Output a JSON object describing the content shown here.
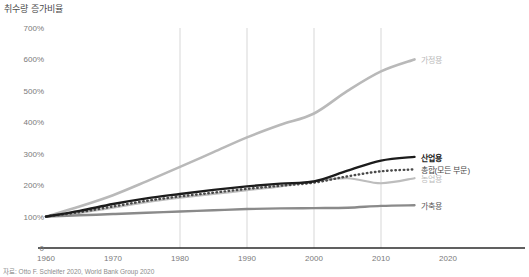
{
  "chart_data": {
    "type": "line",
    "title": "취수량 증가비율",
    "xlabel": "",
    "ylabel": "",
    "xlim": [
      1960,
      2020
    ],
    "ylim": [
      0,
      700
    ],
    "grid": "vertical gridlines at 1980, 1990, 2000, 2010",
    "legend_position": "right-inline labels at end of each series",
    "ytick_labels": [
      "0",
      "100%",
      "200%",
      "300%",
      "400%",
      "500%",
      "600%",
      "700%"
    ],
    "ytick_values": [
      0,
      100,
      200,
      300,
      400,
      500,
      600,
      700
    ],
    "xtick_labels": [
      "1960",
      "1970",
      "1980",
      "1990",
      "2000",
      "2010",
      "2020"
    ],
    "xtick_values": [
      1960,
      1970,
      1980,
      1990,
      2000,
      2010,
      2020
    ],
    "x": [
      1960,
      1965,
      1970,
      1975,
      1980,
      1985,
      1990,
      1995,
      2000,
      2005,
      2010,
      2015
    ],
    "series": [
      {
        "name": "가정용",
        "label": "가정용",
        "color": "#b9b9b9",
        "style": "solid",
        "width": 2.6,
        "label_color": "#b9b9b9",
        "label_weight": "normal",
        "values": [
          100,
          132,
          168,
          212,
          258,
          305,
          352,
          392,
          428,
          500,
          562,
          600
        ]
      },
      {
        "name": "산업용",
        "label": "산업용",
        "color": "#1c1c1c",
        "style": "solid",
        "width": 2.4,
        "label_color": "#1c1c1c",
        "label_weight": "bold",
        "values": [
          100,
          118,
          140,
          158,
          172,
          185,
          196,
          205,
          212,
          246,
          278,
          290
        ]
      },
      {
        "name": "총합(모든 부문)",
        "label": "총합(모든 부문)",
        "color": "#4a4a4a",
        "style": "dotted",
        "width": 2.4,
        "label_color": "#4a4a4a",
        "label_weight": "normal",
        "values": [
          100,
          114,
          132,
          150,
          164,
          176,
          188,
          198,
          208,
          228,
          244,
          250
        ]
      },
      {
        "name": "농업용",
        "label": "농업용",
        "color": "#bdbdbd",
        "style": "solid",
        "width": 2.2,
        "label_color": "#bdbdbd",
        "label_weight": "normal",
        "values": [
          100,
          112,
          128,
          146,
          160,
          172,
          184,
          196,
          212,
          222,
          206,
          222
        ]
      },
      {
        "name": "가축용",
        "label": "가축용",
        "color": "#8a8a8a",
        "style": "solid",
        "width": 2.4,
        "label_color": "#5a5a5a",
        "label_weight": "normal",
        "values": [
          100,
          104,
          108,
          112,
          116,
          120,
          124,
          126,
          127,
          128,
          134,
          136
        ]
      }
    ],
    "source": "자료: Otto F. Schleifer 2020, World Bank Group 2020"
  },
  "colors": {
    "axis": "#2b2b2b",
    "gridline": "#d7d7d7",
    "tick_text": "#7a7a7a",
    "title_text": "#4a4a4a",
    "footer_text": "#8c8c8c",
    "background": "#ffffff"
  }
}
